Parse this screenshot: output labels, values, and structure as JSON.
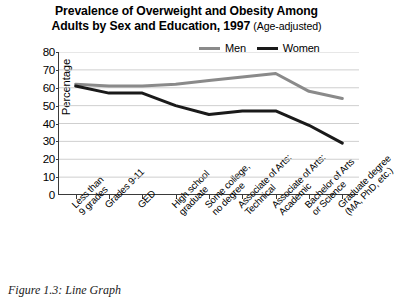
{
  "title": {
    "line1": "Prevalence of Overweight and Obesity Among",
    "line2_main": "Adults by Sex and Education, 1997 ",
    "line2_sub": "(Age-adjusted)"
  },
  "caption": "Figure 1.3: Line Graph",
  "legend": {
    "position": "top-right-inside",
    "entries": [
      {
        "label": "Men",
        "color": "#8a8a8a"
      },
      {
        "label": "Women",
        "color": "#1a1a1a"
      }
    ]
  },
  "axis": {
    "y_title": "Percentage",
    "y_ticks": [
      0,
      10,
      20,
      30,
      40,
      50,
      60,
      70,
      80
    ]
  },
  "chart_data": {
    "type": "line",
    "title": "Prevalence of Overweight and Obesity Among Adults by Sex and Education, 1997 (Age-adjusted)",
    "xlabel": "",
    "ylabel": "Percentage",
    "ylim": [
      0,
      80
    ],
    "yticks": [
      0,
      10,
      20,
      30,
      40,
      50,
      60,
      70,
      80
    ],
    "grid": true,
    "legend_position": "upper right",
    "categories": [
      "Less than 9 grades",
      "Grades 9-11",
      "GED",
      "High school graduate",
      "Some college, no degree",
      "Associate of Arts: Technical",
      "Associate of Arts: Academic",
      "Bachelor of Arts or Science",
      "Graduate degree (MA, PhD, etc.)"
    ],
    "category_lines": [
      [
        "Less than",
        "9 grades"
      ],
      [
        "Grades 9-11",
        ""
      ],
      [
        "GED",
        ""
      ],
      [
        "High school",
        "graduate"
      ],
      [
        "Some college,",
        "no degree"
      ],
      [
        "Associate of Arts:",
        "Technical"
      ],
      [
        "Associate of Arts:",
        "Academic"
      ],
      [
        "Bachelor of Arts",
        "or Science"
      ],
      [
        "Graduate degree",
        "(MA, PhD, etc.)"
      ]
    ],
    "series": [
      {
        "name": "Men",
        "color": "#8a8a8a",
        "values": [
          62,
          61,
          61,
          62,
          64,
          66,
          68,
          58,
          54
        ]
      },
      {
        "name": "Women",
        "color": "#1a1a1a",
        "values": [
          61,
          57,
          57,
          50,
          45,
          47,
          47,
          39,
          29
        ]
      }
    ]
  }
}
